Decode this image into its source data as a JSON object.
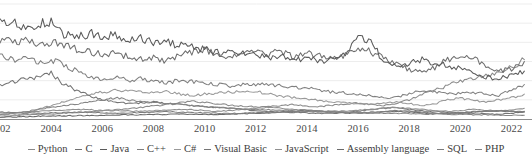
{
  "chart_data": {
    "type": "line",
    "title": "",
    "subtitle": "",
    "xlabel": "",
    "ylabel": "",
    "grid": true,
    "legend_position": "bottom",
    "xlim": [
      2002,
      2022.8
    ],
    "ylim": [
      0,
      30
    ],
    "x_ticks": [
      2002,
      2004,
      2006,
      2008,
      2010,
      2012,
      2014,
      2016,
      2018,
      2020,
      2022
    ],
    "x_tick_labels": [
      "2002",
      "2004",
      "2006",
      "2008",
      "2010",
      "2012",
      "2014",
      "2016",
      "2018",
      "2020",
      "2022"
    ],
    "y_gridlines": [
      0,
      5,
      10,
      15,
      20,
      25,
      30
    ],
    "x": [
      2002.0,
      2002.5,
      2003.0,
      2003.5,
      2004.0,
      2004.5,
      2005.0,
      2005.5,
      2006.0,
      2006.5,
      2007.0,
      2007.5,
      2008.0,
      2008.5,
      2009.0,
      2009.5,
      2010.0,
      2010.5,
      2011.0,
      2011.5,
      2012.0,
      2012.5,
      2013.0,
      2013.5,
      2014.0,
      2014.5,
      2015.0,
      2015.5,
      2016.0,
      2016.5,
      2017.0,
      2017.5,
      2018.0,
      2018.5,
      2019.0,
      2019.5,
      2020.0,
      2020.5,
      2021.0,
      2021.5,
      2022.0,
      2022.5
    ],
    "series": [
      {
        "name": "Python",
        "color": "#8a8a8a",
        "values": [
          1.0,
          1.0,
          1.1,
          1.2,
          1.3,
          1.5,
          1.7,
          1.9,
          2.2,
          2.4,
          2.7,
          3.0,
          3.4,
          3.8,
          4.2,
          4.6,
          4.4,
          4.0,
          3.6,
          3.4,
          3.2,
          3.3,
          3.5,
          3.8,
          3.4,
          3.2,
          3.6,
          4.0,
          4.2,
          3.8,
          3.5,
          3.9,
          5.0,
          6.3,
          7.5,
          8.8,
          9.8,
          10.5,
          11.2,
          12.0,
          13.5,
          15.5
        ]
      },
      {
        "name": "C",
        "color": "#6e6e6e",
        "values": [
          21.0,
          19.8,
          20.5,
          19.0,
          20.2,
          19.5,
          18.2,
          17.5,
          16.8,
          17.5,
          16.2,
          15.5,
          16.0,
          15.2,
          16.5,
          17.2,
          18.0,
          17.0,
          16.0,
          17.2,
          17.8,
          17.0,
          17.5,
          16.0,
          17.2,
          16.5,
          16.0,
          16.8,
          18.5,
          17.5,
          16.0,
          14.5,
          13.0,
          12.0,
          13.5,
          15.5,
          16.5,
          16.0,
          13.5,
          12.5,
          13.0,
          15.0
        ]
      },
      {
        "name": "Java",
        "color": "#5a5a5a",
        "values": [
          26.5,
          25.0,
          24.0,
          24.5,
          25.5,
          22.0,
          21.0,
          22.5,
          21.5,
          22.0,
          20.5,
          21.0,
          20.0,
          20.5,
          19.0,
          19.5,
          18.0,
          17.5,
          17.0,
          17.5,
          17.0,
          16.0,
          16.5,
          15.5,
          16.0,
          15.0,
          15.5,
          16.5,
          21.0,
          20.0,
          15.0,
          13.5,
          14.5,
          15.5,
          14.5,
          14.0,
          13.0,
          12.0,
          11.0,
          10.5,
          11.5,
          12.5
        ]
      },
      {
        "name": "C++",
        "color": "#808080",
        "values": [
          16.5,
          15.5,
          16.0,
          15.0,
          15.5,
          14.0,
          12.5,
          11.0,
          10.5,
          11.0,
          10.0,
          10.5,
          10.0,
          9.5,
          10.0,
          9.8,
          9.5,
          9.0,
          8.5,
          9.0,
          8.8,
          9.2,
          8.5,
          8.2,
          8.0,
          7.5,
          7.0,
          6.8,
          6.5,
          6.2,
          5.5,
          5.8,
          6.5,
          7.5,
          7.0,
          6.5,
          6.8,
          7.0,
          6.5,
          6.2,
          7.5,
          9.0
        ]
      },
      {
        "name": "C#",
        "color": "#999999",
        "values": [
          0.5,
          0.8,
          1.5,
          2.5,
          3.5,
          4.5,
          5.5,
          6.5,
          7.0,
          7.5,
          7.2,
          7.0,
          6.8,
          7.2,
          6.5,
          6.2,
          6.5,
          6.8,
          7.0,
          7.5,
          7.2,
          6.5,
          6.0,
          5.5,
          5.2,
          4.8,
          4.5,
          4.2,
          4.0,
          3.8,
          4.2,
          4.5,
          4.0,
          3.5,
          4.0,
          5.0,
          5.5,
          4.8,
          4.5,
          5.0,
          5.5,
          6.5
        ]
      },
      {
        "name": "Visual Basic",
        "color": "#747474",
        "values": [
          9.0,
          9.5,
          10.5,
          11.0,
          12.0,
          9.0,
          7.5,
          6.0,
          5.0,
          4.5,
          4.0,
          4.2,
          4.5,
          4.0,
          3.8,
          3.5,
          3.2,
          3.0,
          2.8,
          2.5,
          2.2,
          2.0,
          1.8,
          1.7,
          1.6,
          1.5,
          1.5,
          1.6,
          2.0,
          2.5,
          2.8,
          3.0,
          2.5,
          2.2,
          2.0,
          1.8,
          1.5,
          1.4,
          1.3,
          1.2,
          1.5,
          2.0
        ]
      },
      {
        "name": "JavaScript",
        "color": "#8f8f8f",
        "values": [
          1.5,
          1.6,
          1.8,
          2.0,
          2.2,
          2.3,
          2.5,
          2.4,
          2.3,
          2.2,
          2.1,
          2.0,
          2.2,
          2.3,
          2.5,
          2.4,
          2.2,
          2.0,
          2.2,
          2.5,
          2.8,
          3.0,
          2.8,
          2.5,
          2.3,
          2.2,
          2.0,
          2.1,
          2.3,
          2.5,
          2.8,
          3.0,
          2.8,
          2.5,
          2.2,
          2.0,
          2.2,
          2.5,
          2.3,
          2.1,
          2.4,
          2.8
        ]
      },
      {
        "name": "Assembly language",
        "color": "#6a6a6a",
        "values": [
          0.5,
          0.5,
          0.6,
          0.7,
          0.8,
          0.8,
          0.9,
          0.9,
          1.0,
          1.0,
          1.1,
          1.1,
          1.2,
          1.2,
          1.3,
          1.3,
          1.2,
          1.2,
          1.3,
          1.4,
          1.5,
          1.6,
          1.8,
          2.0,
          2.2,
          2.0,
          1.8,
          1.6,
          1.5,
          1.6,
          1.8,
          2.0,
          1.8,
          1.6,
          1.5,
          1.4,
          1.6,
          1.8,
          2.0,
          2.2,
          2.0,
          1.8
        ]
      },
      {
        "name": "SQL",
        "color": "#7d7d7d",
        "values": [
          1.8,
          1.7,
          1.6,
          1.5,
          1.6,
          1.7,
          1.8,
          1.7,
          1.6,
          1.5,
          1.6,
          1.7,
          1.8,
          1.9,
          1.8,
          1.7,
          1.6,
          1.5,
          1.4,
          1.5,
          1.6,
          1.7,
          1.8,
          1.9,
          2.0,
          1.9,
          1.8,
          1.7,
          1.6,
          1.8,
          2.0,
          2.2,
          2.0,
          1.8,
          1.6,
          1.5,
          1.7,
          1.9,
          2.0,
          2.1,
          2.0,
          1.9
        ]
      },
      {
        "name": "PHP",
        "color": "#858585",
        "values": [
          1.2,
          1.5,
          2.0,
          2.5,
          3.0,
          3.5,
          4.0,
          4.5,
          5.0,
          5.5,
          5.0,
          4.5,
          4.2,
          4.0,
          3.8,
          3.5,
          3.2,
          3.0,
          2.8,
          2.6,
          2.5,
          2.4,
          2.3,
          2.2,
          2.1,
          2.0,
          1.9,
          1.8,
          1.7,
          1.6,
          1.5,
          1.5,
          1.4,
          1.3,
          1.3,
          1.2,
          1.2,
          1.1,
          1.1,
          1.0,
          1.0,
          1.0
        ]
      }
    ],
    "legend": [
      "Python",
      "C",
      "Java",
      "C++",
      "C#",
      "Visual Basic",
      "JavaScript",
      "Assembly language",
      "SQL",
      "PHP"
    ]
  }
}
